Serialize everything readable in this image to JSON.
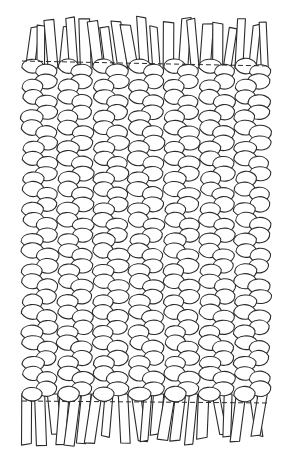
{
  "illustration": {
    "subject": "braided rug with fringed ends",
    "colors": {
      "ink": "#2b2b2b",
      "background": "#ffffff"
    },
    "braid_columns": 7,
    "braid_rows": 22,
    "body": {
      "left": 22,
      "right": 270,
      "top": 62,
      "bottom": 400
    },
    "dashed_lines": [
      {
        "y1": 61,
        "y2": 66,
        "x1": 22,
        "x2": 270
      },
      {
        "y1": 401,
        "y2": 403,
        "x1": 22,
        "x2": 270
      }
    ]
  }
}
